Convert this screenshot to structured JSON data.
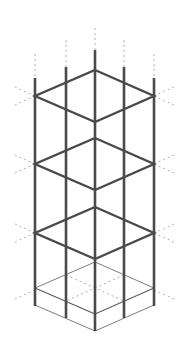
{
  "diagram": {
    "title": "Isometric column reinforcement cage on footing",
    "colors": {
      "background": "#ffffff",
      "rebar": "#4a4a4a",
      "guide": "#9a9a9a",
      "slab_top": "#c8c8c8",
      "slab_left": "#8e8e8e",
      "slab_right": "#b4b4b4"
    },
    "vertical_bars": [
      {
        "id": "left",
        "x": 35,
        "top": 78,
        "bottom": 306,
        "guide_top": 54
      },
      {
        "id": "left-mid",
        "x": 66,
        "top": 67,
        "bottom": 318,
        "guide_top": 40
      },
      {
        "id": "center",
        "x": 95,
        "top": 50,
        "bottom": 331,
        "guide_top": 28
      },
      {
        "id": "right-mid",
        "x": 124,
        "top": 67,
        "bottom": 318,
        "guide_top": 40
      },
      {
        "id": "right",
        "x": 154,
        "top": 78,
        "bottom": 306,
        "guide_top": 54
      }
    ],
    "stirrups": [
      {
        "level": 1,
        "back_y": 70,
        "side_y": 96,
        "front_y": 122
      },
      {
        "level": 2,
        "back_y": 138,
        "side_y": 164,
        "front_y": 190
      },
      {
        "level": 3,
        "back_y": 207,
        "side_y": 233,
        "front_y": 259
      }
    ],
    "footing": {
      "top": {
        "back": [
          95,
          262
        ],
        "left": [
          35,
          288
        ],
        "front": [
          95,
          314
        ],
        "right": [
          154,
          288
        ]
      },
      "bottom": {
        "left": [
          35,
          305
        ],
        "front": [
          95,
          331
        ],
        "right": [
          154,
          305
        ]
      }
    }
  }
}
